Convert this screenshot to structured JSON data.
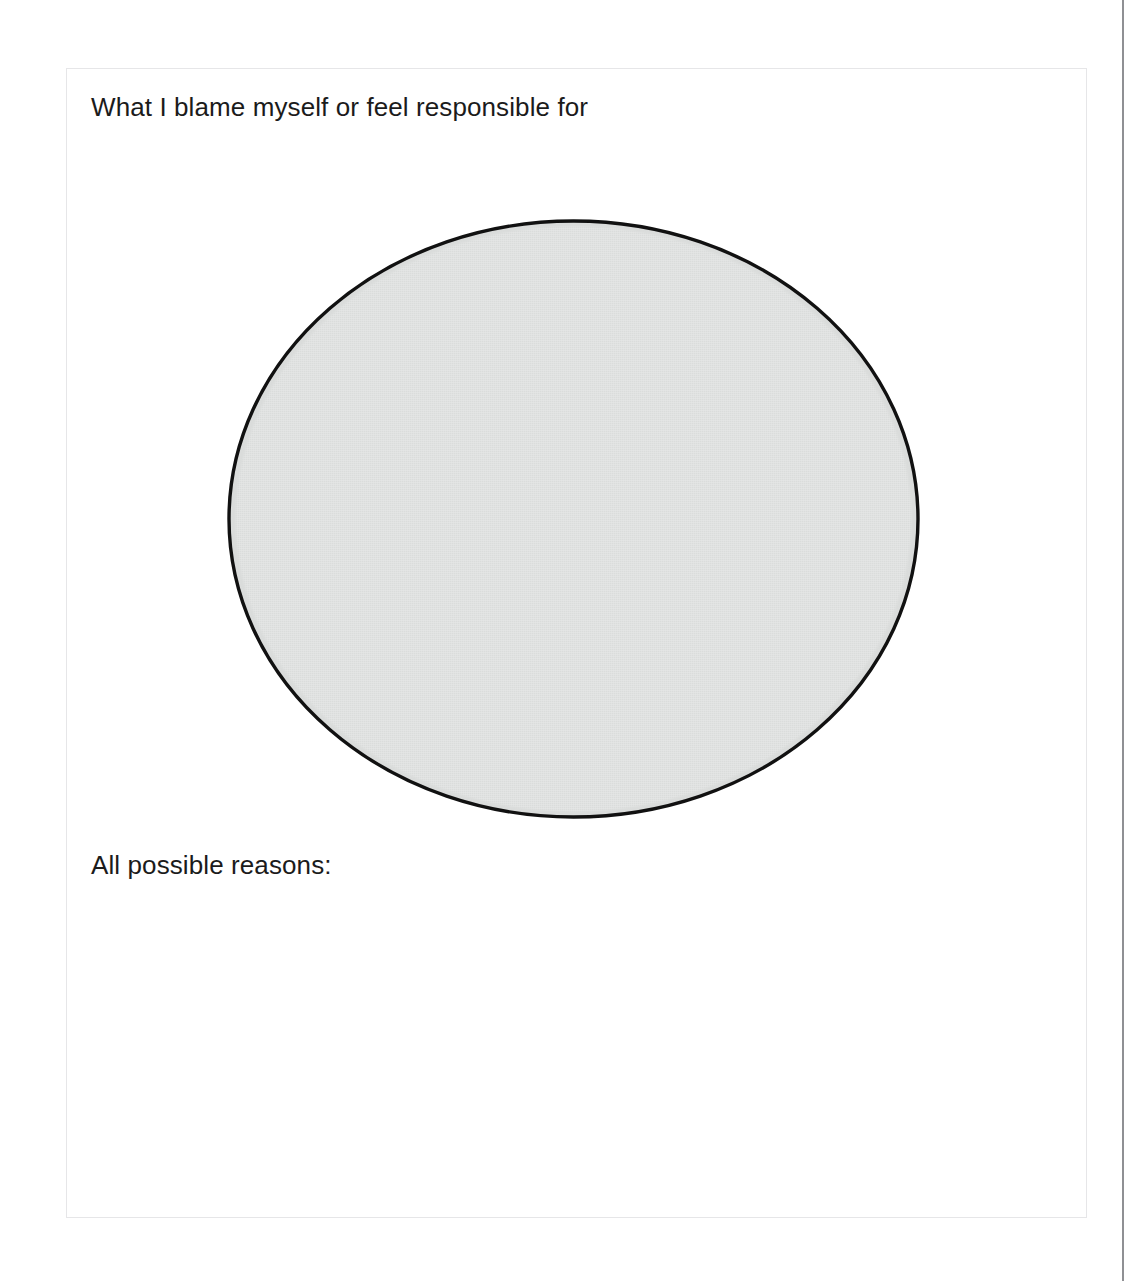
{
  "page": {
    "background_color": "#ffffff",
    "width": 1143,
    "height": 1281,
    "clipped_top_text": "",
    "edge_rule_color": "#8f9094"
  },
  "worksheet": {
    "border_color": "#e6e6e8",
    "background_color": "#ffffff",
    "prompt_primary": "What I blame myself or feel responsible for",
    "prompt_secondary": "All possible reasons:",
    "text_color": "#1b1b1b",
    "ellipse": {
      "label": "blame-response-area",
      "fill_color": "#dadcdb",
      "stroke_color": "#111111",
      "stroke_width": 3,
      "width": 693,
      "height": 600
    },
    "writing_area_placeholder": ""
  }
}
